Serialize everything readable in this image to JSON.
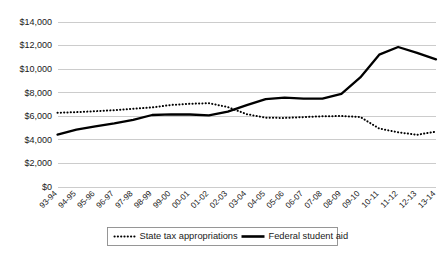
{
  "chart_data": {
    "type": "line",
    "title": "",
    "subtitle": "",
    "xlabel": "",
    "ylabel": "",
    "ylim": [
      0,
      14000
    ],
    "ytick_labels": [
      "$0",
      "$2,000",
      "$4,000",
      "$6,000",
      "$8,000",
      "$10,000",
      "$12,000",
      "$14,000"
    ],
    "ytick_values": [
      0,
      2000,
      4000,
      6000,
      8000,
      10000,
      12000,
      14000
    ],
    "grid": true,
    "legend_position": "bottom",
    "categories": [
      "93-94",
      "94-95",
      "95-96",
      "96-97",
      "97-98",
      "98-99",
      "99-00",
      "00-01",
      "01-02",
      "02-03",
      "03-04",
      "04-05",
      "05-06",
      "06-07",
      "07-08",
      "08-09",
      "09-10",
      "10-11",
      "11-12",
      "12-13",
      "13-14"
    ],
    "series": [
      {
        "name": "State tax appropriations",
        "style": "dotted",
        "color": "#000000",
        "values": [
          6300,
          6350,
          6430,
          6520,
          6640,
          6750,
          6960,
          7060,
          7110,
          6780,
          6180,
          5880,
          5860,
          5930,
          6000,
          6020,
          5940,
          4960,
          4640,
          4430,
          4700
        ]
      },
      {
        "name": "Federal student aid",
        "style": "solid",
        "color": "#000000",
        "values": [
          4450,
          4870,
          5140,
          5400,
          5700,
          6110,
          6160,
          6150,
          6070,
          6400,
          6940,
          7450,
          7580,
          7500,
          7490,
          7900,
          9300,
          11230,
          11880,
          11380,
          10830
        ]
      }
    ]
  },
  "legend": {
    "items": [
      {
        "label": "State tax appropriations",
        "style": "dotted"
      },
      {
        "label": "Federal student aid",
        "style": "solid"
      }
    ]
  }
}
